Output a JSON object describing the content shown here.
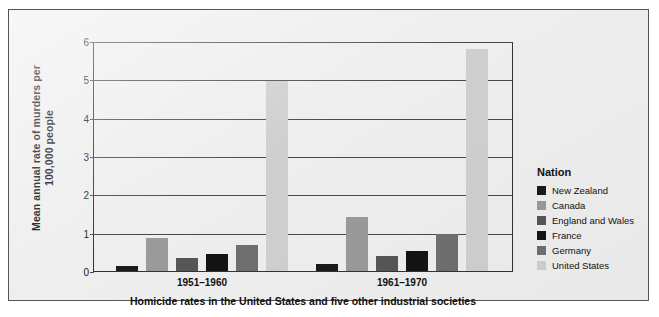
{
  "chart_data": {
    "type": "bar",
    "title": "",
    "caption": "Homicide rates in the United States and five other industrial societies",
    "xlabel": "",
    "ylabel": "Mean annual rate of murders per 100,000 people",
    "categories": [
      "1951–1960",
      "1961–1970"
    ],
    "ylim": [
      0,
      6
    ],
    "yticks": [
      0,
      1,
      2,
      3,
      4,
      5,
      6
    ],
    "ytick_labels": [
      "0",
      "1",
      "2",
      "3",
      "4",
      "5",
      "6"
    ],
    "grid": true,
    "legend_position": "right",
    "legend_title": "Nation",
    "series": [
      {
        "name": "New Zealand",
        "color": "#1a1a1a",
        "values": [
          0.13,
          0.17
        ]
      },
      {
        "name": "Canada",
        "color": "#9a9a9a",
        "values": [
          0.85,
          1.4
        ]
      },
      {
        "name": "England and Wales",
        "color": "#565656",
        "values": [
          0.35,
          0.4
        ]
      },
      {
        "name": "France",
        "color": "#141414",
        "values": [
          0.45,
          0.52
        ]
      },
      {
        "name": "Germany",
        "color": "#6f6f6f",
        "values": [
          0.67,
          0.96
        ]
      },
      {
        "name": "United States",
        "color": "#cfcfcf",
        "values": [
          4.95,
          5.78
        ]
      }
    ]
  },
  "colors": {
    "page_background": "#ffffff",
    "panel_background": "#eeeeee",
    "panel_border": "#555555",
    "axis": "#333333",
    "gridline": "#4a4a4a",
    "text": "#111111"
  }
}
